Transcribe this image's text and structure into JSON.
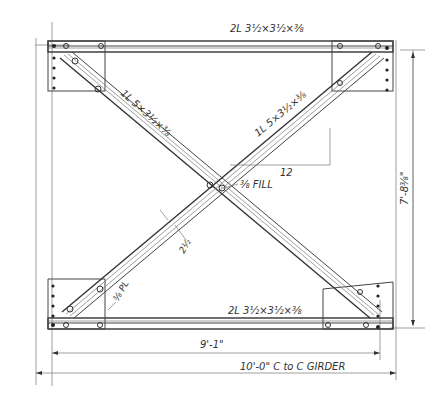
{
  "drawing": {
    "type": "steel cross-bracing detail",
    "colors": {
      "line": "#333333",
      "background": "#ffffff"
    },
    "labels": {
      "top_chord": "2L 3½×3½×⅜",
      "bottom_chord": "2L 3½×3½×⅜",
      "diagonal_upper_left": "1L 5×3½×⅜",
      "diagonal_upper_right": "1L 5×3½×⅜",
      "slope": "12",
      "fill": "⅜ FILL",
      "gauge": "2½",
      "gusset_plate": "⅜ PL",
      "inner_span": "9'-1\"",
      "overall_span": "10'-0\" C to C GIRDER",
      "height": "7'-8⅜\""
    }
  }
}
